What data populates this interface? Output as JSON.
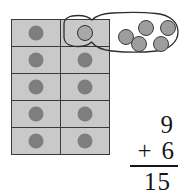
{
  "scene": {
    "title": "Ten frame with regrouped ones and vertical addition",
    "background_color": "#ffffff",
    "width": 185,
    "height": 194
  },
  "ten_frame": {
    "name": "ten-frame",
    "columns": 2,
    "rows": 5,
    "total_cells": 10,
    "cell_fill_color": "#c9c9c9",
    "cell_border_color": "#3a3a3a",
    "dot_color": "#7e7e7e",
    "cells": [
      {
        "row": 1,
        "column": 1,
        "dot_count": 1,
        "circled": false
      },
      {
        "row": 1,
        "column": 2,
        "dot_count": 1,
        "circled": true
      },
      {
        "row": 2,
        "column": 1,
        "dot_count": 1,
        "circled": false
      },
      {
        "row": 2,
        "column": 2,
        "dot_count": 1,
        "circled": false
      },
      {
        "row": 3,
        "column": 1,
        "dot_count": 1,
        "circled": false
      },
      {
        "row": 3,
        "column": 2,
        "dot_count": 1,
        "circled": false
      },
      {
        "row": 4,
        "column": 1,
        "dot_count": 1,
        "circled": false
      },
      {
        "row": 4,
        "column": 2,
        "dot_count": 1,
        "circled": false
      },
      {
        "row": 5,
        "column": 1,
        "dot_count": 1,
        "circled": false
      },
      {
        "row": 5,
        "column": 2,
        "dot_count": 1,
        "circled": false
      }
    ]
  },
  "balloon": {
    "name": "lasso-balloon",
    "dot_count": 5,
    "dot_color": "#9d9d9d",
    "outline_color": "#2e2e2e",
    "dots": [
      {
        "index": 1,
        "x": 118,
        "y": 29
      },
      {
        "index": 2,
        "x": 138,
        "y": 20
      },
      {
        "index": 3,
        "x": 160,
        "y": 20
      },
      {
        "index": 4,
        "x": 131,
        "y": 36
      },
      {
        "index": 5,
        "x": 153,
        "y": 36
      }
    ]
  },
  "sum": {
    "name": "vertical-addition",
    "addend1": "9",
    "operator": "+",
    "addend2": "6",
    "total": "15",
    "text_color": "#16161a"
  }
}
